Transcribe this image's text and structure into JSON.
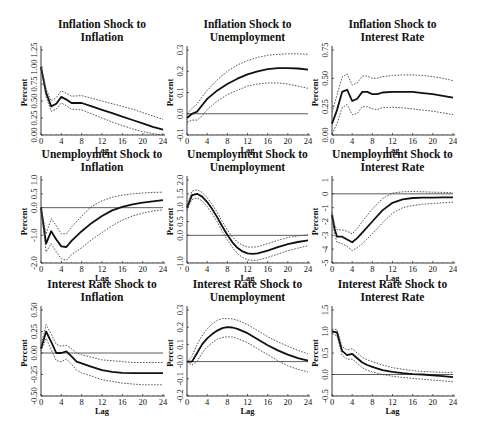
{
  "figure": {
    "layout": {
      "rows": 3,
      "cols": 3
    },
    "x_axis_label": "Lag",
    "y_axis_label": "Percent",
    "x_ticks": [
      0,
      4,
      8,
      12,
      16,
      20,
      24
    ],
    "line_styles": {
      "estimate": "solid thick",
      "bands": "dotted",
      "zero_line": "solid thin"
    }
  },
  "chart_data": [
    {
      "type": "line",
      "title": "Inflation Shock to Inflation",
      "title_lines": [
        "Inflation Shock to",
        "Inflation"
      ],
      "xlabel": "Lag",
      "ylabel": "Percent",
      "xlim": [
        0,
        24
      ],
      "ylim": [
        0,
        1.25
      ],
      "yticks": [
        "0.00",
        "0.25",
        "0.50",
        "0.75",
        "1.00",
        "1.25"
      ],
      "ytick_values": [
        0,
        0.25,
        0.5,
        0.75,
        1.0,
        1.25
      ],
      "zero_line": false,
      "x": [
        0,
        1,
        2,
        3,
        4,
        5,
        6,
        8,
        10,
        12,
        14,
        16,
        18,
        20,
        22,
        24
      ],
      "series": [
        {
          "name": "estimate",
          "values": [
            1.0,
            0.62,
            0.42,
            0.46,
            0.56,
            0.52,
            0.47,
            0.47,
            0.42,
            0.37,
            0.32,
            0.27,
            0.22,
            0.17,
            0.12,
            0.08
          ]
        },
        {
          "name": "upper",
          "values": [
            1.0,
            0.68,
            0.5,
            0.55,
            0.65,
            0.61,
            0.57,
            0.58,
            0.54,
            0.5,
            0.46,
            0.42,
            0.38,
            0.33,
            0.28,
            0.23
          ]
        },
        {
          "name": "lower",
          "values": [
            1.0,
            0.56,
            0.35,
            0.38,
            0.47,
            0.43,
            0.38,
            0.37,
            0.31,
            0.25,
            0.19,
            0.14,
            0.09,
            0.05,
            0.02,
            0.0
          ]
        }
      ]
    },
    {
      "type": "line",
      "title": "Inflation Shock to Unemployment",
      "title_lines": [
        "Inflation Shock to",
        "Unemployment"
      ],
      "xlabel": "Lag",
      "ylabel": "Percent",
      "xlim": [
        0,
        24
      ],
      "ylim": [
        -0.1,
        0.3
      ],
      "yticks": [
        "-0.1",
        "0.0",
        "0.1",
        "0.2",
        "0.3"
      ],
      "ytick_values": [
        -0.1,
        0.0,
        0.1,
        0.2,
        0.3
      ],
      "zero_line": true,
      "x": [
        0,
        1,
        2,
        3,
        4,
        6,
        8,
        10,
        12,
        14,
        16,
        18,
        20,
        22,
        24
      ],
      "series": [
        {
          "name": "estimate",
          "values": [
            -0.02,
            0.0,
            0.01,
            0.04,
            0.07,
            0.11,
            0.14,
            0.165,
            0.185,
            0.2,
            0.21,
            0.215,
            0.215,
            0.213,
            0.208
          ]
        },
        {
          "name": "upper",
          "values": [
            0.0,
            0.025,
            0.045,
            0.08,
            0.11,
            0.16,
            0.2,
            0.23,
            0.25,
            0.265,
            0.275,
            0.28,
            0.282,
            0.282,
            0.28
          ]
        },
        {
          "name": "lower",
          "values": [
            -0.04,
            -0.03,
            -0.03,
            -0.01,
            0.02,
            0.06,
            0.09,
            0.11,
            0.13,
            0.14,
            0.145,
            0.145,
            0.14,
            0.13,
            0.12
          ]
        }
      ]
    },
    {
      "type": "line",
      "title": "Inflation Shock to Interest Rate",
      "title_lines": [
        "Inflation Shock to",
        "Interest Rate"
      ],
      "xlabel": "Lag",
      "ylabel": "Percent",
      "xlim": [
        0,
        24
      ],
      "ylim": [
        0,
        0.75
      ],
      "yticks": [
        "0.00",
        "0.25",
        "0.50",
        "0.75"
      ],
      "ytick_values": [
        0,
        0.25,
        0.5,
        0.75
      ],
      "zero_line": false,
      "x": [
        0,
        1,
        2,
        3,
        4,
        5,
        6,
        7,
        8,
        9,
        10,
        12,
        14,
        16,
        18,
        20,
        22,
        24
      ],
      "series": [
        {
          "name": "estimate",
          "values": [
            0.1,
            0.22,
            0.38,
            0.4,
            0.3,
            0.32,
            0.38,
            0.38,
            0.36,
            0.36,
            0.375,
            0.38,
            0.38,
            0.38,
            0.37,
            0.36,
            0.345,
            0.33
          ]
        },
        {
          "name": "upper",
          "values": [
            0.2,
            0.35,
            0.51,
            0.54,
            0.44,
            0.46,
            0.52,
            0.52,
            0.5,
            0.5,
            0.515,
            0.525,
            0.53,
            0.53,
            0.525,
            0.515,
            0.5,
            0.48
          ]
        },
        {
          "name": "lower",
          "values": [
            0.01,
            0.1,
            0.24,
            0.27,
            0.18,
            0.19,
            0.25,
            0.25,
            0.23,
            0.225,
            0.24,
            0.245,
            0.24,
            0.23,
            0.22,
            0.21,
            0.195,
            0.18
          ]
        }
      ]
    },
    {
      "type": "line",
      "title": "Unemployment Shock to Inflation",
      "title_lines": [
        "Unemployment Shock to",
        "Inflation"
      ],
      "xlabel": "Lag",
      "ylabel": "Percent",
      "xlim": [
        0,
        24
      ],
      "ylim": [
        -2.0,
        1.0
      ],
      "yticks": [
        "-2.0",
        "-1.0",
        "0.0",
        "0.5",
        "1.0"
      ],
      "ytick_values": [
        -2.0,
        -1.0,
        0.0,
        0.5,
        1.0
      ],
      "zero_line": true,
      "x": [
        0,
        1,
        2,
        3,
        4,
        5,
        6,
        8,
        10,
        12,
        14,
        16,
        18,
        20,
        22,
        24
      ],
      "series": [
        {
          "name": "estimate",
          "values": [
            0.0,
            -1.3,
            -0.85,
            -1.15,
            -1.4,
            -1.42,
            -1.2,
            -0.85,
            -0.55,
            -0.3,
            -0.1,
            0.03,
            0.12,
            0.18,
            0.23,
            0.27
          ]
        },
        {
          "name": "upper",
          "values": [
            0.0,
            -0.95,
            -0.4,
            -0.65,
            -0.95,
            -0.95,
            -0.7,
            -0.3,
            0.05,
            0.25,
            0.38,
            0.45,
            0.5,
            0.53,
            0.55,
            0.56
          ]
        },
        {
          "name": "lower",
          "values": [
            0.0,
            -1.6,
            -1.3,
            -1.6,
            -1.85,
            -1.9,
            -1.7,
            -1.45,
            -1.15,
            -0.9,
            -0.65,
            -0.45,
            -0.3,
            -0.2,
            -0.12,
            -0.08
          ]
        }
      ]
    },
    {
      "type": "line",
      "title": "Unemployment Shock to Unemployment",
      "title_lines": [
        "Unemployment Shock to",
        "Unemployment"
      ],
      "xlabel": "Lag",
      "ylabel": "Percent",
      "xlim": [
        0,
        24
      ],
      "ylim": [
        -1.0,
        2.0
      ],
      "yticks": [
        "-1.0",
        "0.0",
        "0.5",
        "1.0",
        "1.5",
        "2.0"
      ],
      "ytick_values": [
        -1.0,
        0.0,
        0.5,
        1.0,
        1.5,
        2.0
      ],
      "zero_line": true,
      "x": [
        0,
        1,
        2,
        3,
        4,
        5,
        6,
        7,
        8,
        9,
        10,
        11,
        12,
        13,
        14,
        16,
        18,
        20,
        22,
        24
      ],
      "series": [
        {
          "name": "estimate",
          "values": [
            1.0,
            1.45,
            1.5,
            1.4,
            1.2,
            0.95,
            0.65,
            0.32,
            0.02,
            -0.25,
            -0.45,
            -0.58,
            -0.65,
            -0.67,
            -0.65,
            -0.55,
            -0.43,
            -0.32,
            -0.24,
            -0.18
          ]
        },
        {
          "name": "upper",
          "values": [
            1.1,
            1.6,
            1.65,
            1.55,
            1.36,
            1.12,
            0.82,
            0.5,
            0.2,
            -0.06,
            -0.24,
            -0.36,
            -0.42,
            -0.43,
            -0.41,
            -0.3,
            -0.18,
            -0.08,
            -0.02,
            0.02
          ]
        },
        {
          "name": "lower",
          "values": [
            0.9,
            1.3,
            1.35,
            1.25,
            1.04,
            0.78,
            0.48,
            0.14,
            -0.16,
            -0.44,
            -0.66,
            -0.8,
            -0.88,
            -0.91,
            -0.9,
            -0.8,
            -0.68,
            -0.56,
            -0.46,
            -0.38
          ]
        }
      ]
    },
    {
      "type": "line",
      "title": "Unemployment Shock to Interest Rate",
      "title_lines": [
        "Unemployment Shock to",
        "Interest Rate"
      ],
      "xlabel": "Lag",
      "ylabel": "Percent",
      "xlim": [
        0,
        24
      ],
      "ylim": [
        -5,
        1
      ],
      "yticks": [
        "-5",
        "-4",
        "-3",
        "-2",
        "-1",
        "0",
        "1"
      ],
      "ytick_values": [
        -5,
        -4,
        -3,
        -2,
        -1,
        0,
        1
      ],
      "zero_line": true,
      "x": [
        0,
        0.5,
        1,
        2,
        3,
        4,
        5,
        6,
        8,
        10,
        12,
        14,
        16,
        18,
        20,
        22,
        24
      ],
      "series": [
        {
          "name": "estimate",
          "values": [
            -1.5,
            -2.5,
            -3.1,
            -3.1,
            -3.3,
            -3.5,
            -3.2,
            -2.8,
            -2.0,
            -1.2,
            -0.65,
            -0.4,
            -0.3,
            -0.28,
            -0.27,
            -0.26,
            -0.25
          ]
        },
        {
          "name": "upper",
          "values": [
            -1.3,
            -2.2,
            -2.6,
            -2.6,
            -2.7,
            -2.9,
            -2.5,
            -2.0,
            -1.1,
            -0.35,
            0.05,
            0.15,
            0.17,
            0.15,
            0.12,
            0.1,
            0.08
          ]
        },
        {
          "name": "lower",
          "values": [
            -1.7,
            -2.9,
            -3.5,
            -3.6,
            -3.8,
            -4.1,
            -3.9,
            -3.6,
            -2.9,
            -2.1,
            -1.4,
            -1.0,
            -0.85,
            -0.75,
            -0.7,
            -0.65,
            -0.6
          ]
        }
      ]
    },
    {
      "type": "line",
      "title": "Interest Rate Shock to Inflation",
      "title_lines": [
        "Interest Rate Shock to",
        "Inflation"
      ],
      "xlabel": "Lag",
      "ylabel": "Percent",
      "xlim": [
        0,
        24
      ],
      "ylim": [
        -0.5,
        0.5
      ],
      "yticks": [
        "-0.50",
        "-0.25",
        "0.00",
        "0.25",
        "0.50"
      ],
      "ytick_values": [
        -0.5,
        -0.25,
        0.0,
        0.25,
        0.5
      ],
      "zero_line": true,
      "x": [
        0,
        1,
        2,
        3,
        4,
        5,
        6,
        7,
        8,
        10,
        12,
        14,
        16,
        18,
        20,
        22,
        24
      ],
      "series": [
        {
          "name": "estimate",
          "values": [
            0.05,
            0.25,
            0.13,
            0.0,
            0.0,
            0.02,
            -0.04,
            -0.1,
            -0.12,
            -0.16,
            -0.2,
            -0.22,
            -0.23,
            -0.235,
            -0.235,
            -0.235,
            -0.235
          ]
        },
        {
          "name": "upper",
          "values": [
            0.08,
            0.33,
            0.22,
            0.1,
            0.08,
            0.09,
            0.05,
            0.0,
            -0.02,
            -0.05,
            -0.08,
            -0.09,
            -0.1,
            -0.11,
            -0.11,
            -0.11,
            -0.11
          ]
        },
        {
          "name": "lower",
          "values": [
            0.02,
            0.17,
            0.04,
            -0.09,
            -0.1,
            -0.07,
            -0.13,
            -0.2,
            -0.23,
            -0.27,
            -0.31,
            -0.33,
            -0.35,
            -0.36,
            -0.37,
            -0.37,
            -0.37
          ]
        }
      ]
    },
    {
      "type": "line",
      "title": "Interest Rate Shock to Unemployment",
      "title_lines": [
        "Interest Rate Shock to",
        "Unemployment"
      ],
      "xlabel": "Lag",
      "ylabel": "Percent",
      "xlim": [
        0,
        24
      ],
      "ylim": [
        -0.2,
        0.3
      ],
      "yticks": [
        "-0.2",
        "-0.1",
        "-0.0",
        "0.1",
        "0.2",
        "0.3"
      ],
      "ytick_values": [
        -0.2,
        -0.1,
        0.0,
        0.1,
        0.2,
        0.3
      ],
      "zero_line": true,
      "x": [
        0,
        1,
        2,
        3,
        4,
        5,
        6,
        7,
        8,
        9,
        10,
        12,
        14,
        16,
        18,
        20,
        22,
        24
      ],
      "series": [
        {
          "name": "estimate",
          "values": [
            0.0,
            0.0,
            0.05,
            0.1,
            0.135,
            0.16,
            0.18,
            0.195,
            0.2,
            0.198,
            0.19,
            0.165,
            0.13,
            0.095,
            0.065,
            0.04,
            0.02,
            0.005
          ]
        },
        {
          "name": "upper",
          "values": [
            0.0,
            0.03,
            0.1,
            0.15,
            0.19,
            0.22,
            0.24,
            0.25,
            0.25,
            0.248,
            0.24,
            0.215,
            0.18,
            0.145,
            0.115,
            0.09,
            0.065,
            0.045
          ]
        },
        {
          "name": "lower",
          "values": [
            0.0,
            -0.02,
            0.0,
            0.05,
            0.085,
            0.11,
            0.13,
            0.14,
            0.145,
            0.143,
            0.135,
            0.11,
            0.075,
            0.04,
            0.005,
            -0.025,
            -0.045,
            -0.06
          ]
        }
      ]
    },
    {
      "type": "line",
      "title": "Interest Rate Shock to Interest Rate",
      "title_lines": [
        "Interest Rate Shock to",
        "Interest Rate"
      ],
      "xlabel": "Lag",
      "ylabel": "Percent",
      "xlim": [
        0,
        24
      ],
      "ylim": [
        -0.5,
        1.5
      ],
      "yticks": [
        "-0.5",
        "0.0",
        "0.5",
        "1.0",
        "1.5"
      ],
      "ytick_values": [
        -0.5,
        0.0,
        0.5,
        1.0,
        1.5
      ],
      "zero_line": true,
      "x": [
        0,
        1,
        2,
        3,
        4,
        5,
        6,
        7,
        8,
        10,
        12,
        14,
        16,
        18,
        20,
        22,
        24
      ],
      "series": [
        {
          "name": "estimate",
          "values": [
            1.0,
            0.98,
            0.55,
            0.45,
            0.48,
            0.38,
            0.28,
            0.22,
            0.18,
            0.1,
            0.06,
            0.03,
            0.01,
            0.0,
            -0.02,
            -0.04,
            -0.06
          ]
        },
        {
          "name": "upper",
          "values": [
            1.05,
            1.05,
            0.65,
            0.57,
            0.6,
            0.5,
            0.4,
            0.34,
            0.3,
            0.22,
            0.16,
            0.12,
            0.09,
            0.07,
            0.06,
            0.05,
            0.05
          ]
        },
        {
          "name": "lower",
          "values": [
            0.95,
            0.9,
            0.45,
            0.35,
            0.36,
            0.26,
            0.16,
            0.1,
            0.06,
            0.0,
            -0.04,
            -0.07,
            -0.09,
            -0.11,
            -0.13,
            -0.15,
            -0.17
          ]
        }
      ]
    }
  ]
}
